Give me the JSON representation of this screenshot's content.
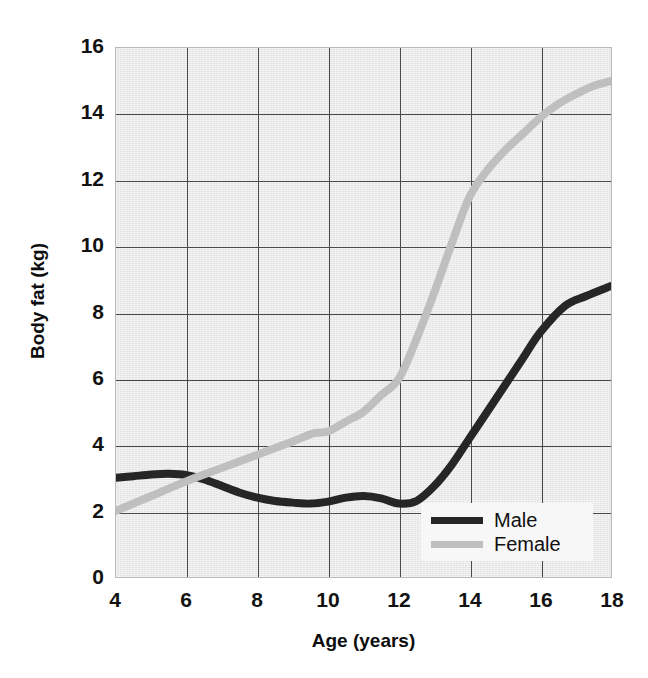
{
  "chart_data": {
    "type": "line",
    "title": "",
    "xlabel": "Age (years)",
    "ylabel": "Body fat (kg)",
    "xlim": [
      4,
      18
    ],
    "ylim": [
      0,
      16
    ],
    "xticks": [
      4,
      6,
      8,
      10,
      12,
      14,
      16,
      18
    ],
    "yticks": [
      0,
      2,
      4,
      6,
      8,
      10,
      12,
      14,
      16
    ],
    "grid": true,
    "legend_position": "bottom-right",
    "plot_background_color": "#ececec",
    "gridline_color": "#4a4a4a",
    "series": [
      {
        "name": "Male",
        "color": "#262626",
        "x": [
          4,
          4.5,
          5,
          5.5,
          6,
          6.5,
          7,
          7.5,
          8,
          8.5,
          9,
          9.5,
          10,
          10.5,
          11,
          11.5,
          12,
          12.5,
          13,
          13.5,
          14,
          14.5,
          15,
          15.5,
          16,
          16.7,
          17.3,
          18
        ],
        "values": [
          3.0,
          3.05,
          3.1,
          3.12,
          3.08,
          2.95,
          2.75,
          2.55,
          2.4,
          2.3,
          2.25,
          2.22,
          2.28,
          2.4,
          2.45,
          2.38,
          2.22,
          2.3,
          2.75,
          3.4,
          4.2,
          5.0,
          5.8,
          6.6,
          7.4,
          8.2,
          8.5,
          8.8
        ]
      },
      {
        "name": "Female",
        "color": "#bfbfbf",
        "x": [
          4,
          5,
          6,
          7,
          8,
          9,
          9.6,
          10,
          10.5,
          11,
          11.5,
          12,
          12.5,
          13,
          13.5,
          14,
          14.5,
          15,
          15.5,
          16,
          16.5,
          17,
          17.5,
          18
        ],
        "values": [
          2.0,
          2.45,
          2.9,
          3.3,
          3.7,
          4.1,
          4.35,
          4.4,
          4.7,
          5.0,
          5.5,
          6.0,
          7.2,
          8.6,
          10.1,
          11.5,
          12.3,
          12.9,
          13.4,
          13.9,
          14.3,
          14.6,
          14.85,
          15.0
        ]
      }
    ],
    "legend": [
      {
        "label": "Male",
        "color": "#262626"
      },
      {
        "label": "Female",
        "color": "#bfbfbf"
      }
    ]
  }
}
